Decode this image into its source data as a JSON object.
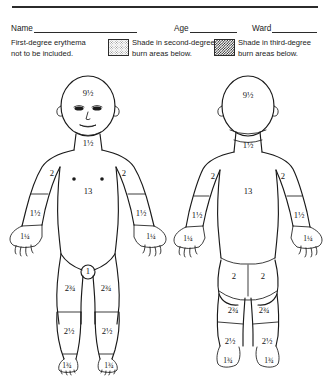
{
  "header": {
    "fields": [
      {
        "label": "Name",
        "value": "",
        "placeholder": ""
      },
      {
        "label": "Age",
        "value": "",
        "placeholder": ""
      },
      {
        "label": "Ward",
        "value": "",
        "placeholder": ""
      }
    ]
  },
  "legend": {
    "first_degree": {
      "line1": "First-degree erythema",
      "line2": "not to be included."
    },
    "second_degree": {
      "swatch": "light-stipple-swatch",
      "line1": "Shade in second-degree",
      "line2": "burn areas below."
    },
    "third_degree": {
      "swatch": "dark-checkerboard-swatch",
      "line1": "Shade in third-degree",
      "line2": "burn areas below."
    }
  },
  "figures": {
    "anterior": {
      "name": "anterior-body-figure",
      "labels": {
        "head": "9½",
        "neck": "1½",
        "upper_arm_left": "2",
        "upper_arm_right": "2",
        "trunk": "13",
        "forearm_left": "1½",
        "forearm_right": "1½",
        "hand_left": "1¼",
        "hand_right": "1¼",
        "genitalia": "1",
        "thigh_left": "2¾",
        "thigh_right": "2¾",
        "leg_left": "2½",
        "leg_right": "2½",
        "foot_left": "1¾",
        "foot_right": "1¾"
      }
    },
    "posterior": {
      "name": "posterior-body-figure",
      "labels": {
        "head": "9½",
        "neck": "1½",
        "upper_arm_left": "2",
        "upper_arm_right": "2",
        "trunk": "13",
        "forearm_left": "1½",
        "forearm_right": "1½",
        "hand_left": "1¼",
        "hand_right": "1¼",
        "buttock_left": "2",
        "buttock_right": "2",
        "thigh_left": "2¾",
        "thigh_right": "2¾",
        "leg_left": "2½",
        "leg_right": "2½",
        "foot_left": "1¾",
        "foot_right": "1¾"
      }
    }
  },
  "colors": {
    "ink": "#1a1a1a",
    "rule": "#2b2b2b",
    "paper": "#ffffff"
  }
}
